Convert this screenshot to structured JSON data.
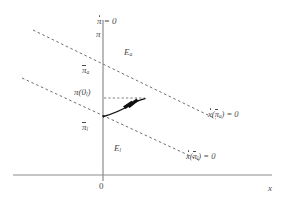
{
  "figure": {
    "type": "phase-diagram",
    "width": 287,
    "height": 203,
    "background": "#ffffff",
    "axis_color": "#8c8c8c",
    "dashed_color": "#6e6e6e",
    "curve_color": "#111111",
    "text_color": "#4a4a4a"
  },
  "axes": {
    "vertical": {
      "name": "pi-axis",
      "label": "π",
      "top_label": "π = 0",
      "top_label_has_dot": true,
      "x": 103,
      "y_top": 20,
      "y_bottom": 181
    },
    "horizontal": {
      "name": "x-axis",
      "label": "x",
      "y": 175,
      "x_left": 13,
      "x_right": 272
    },
    "origin_label": "0"
  },
  "nullclines": [
    {
      "id": "xdot-pibar-a",
      "label": "x(π̄ₐ) = 0",
      "label_parts": {
        "x": "x",
        "open": "(",
        "pi": "π",
        "sub": "a",
        "close": ")",
        "eq": "= 0"
      },
      "style": "dashed",
      "x1": 33,
      "y1": 30,
      "x2": 216,
      "y2": 119
    },
    {
      "id": "xdot-pibar-l",
      "label": "x(π̄ₗ) = 0",
      "label_parts": {
        "x": "x",
        "open": "(",
        "pi": "π",
        "sub": "l",
        "close": ")",
        "eq": "= 0"
      },
      "style": "dashed",
      "x1": 22,
      "y1": 78,
      "x2": 201,
      "y2": 161
    }
  ],
  "labels": {
    "pidot_zero": "π = 0",
    "pi": "π",
    "pibar_a_base": "π",
    "pibar_a_sub": "a",
    "pi_zero_l_base": "π",
    "pi_zero_l_open": "(0",
    "pi_zero_l_sub": "l",
    "pi_zero_l_close": ")",
    "pibar_l_base": "π",
    "pibar_l_sub": "l",
    "region_a_base": "E",
    "region_a_sub": "a",
    "region_l_base": "E",
    "region_l_sub": "l",
    "xdot_a_base": "x",
    "xdot_a_mid": "(",
    "xdot_a_pi": "π",
    "xdot_a_sub": "a",
    "xdot_a_close": ")",
    "xdot_a_eq": "= 0",
    "xdot_l_base": "x",
    "xdot_l_mid": "(",
    "xdot_l_pi": "π",
    "xdot_l_sub": "l",
    "xdot_l_close": ")",
    "xdot_l_eq": "= 0",
    "origin": "0",
    "x_axis": "x"
  },
  "trajectory": {
    "name": "adjustment-path",
    "start": [
      103,
      116
    ],
    "end": [
      144,
      99
    ],
    "arrowhead_at": [
      133,
      103
    ],
    "guide_line": {
      "x1": 104,
      "y1": 98,
      "x2": 144,
      "y2": 98,
      "style": "dashed"
    }
  }
}
